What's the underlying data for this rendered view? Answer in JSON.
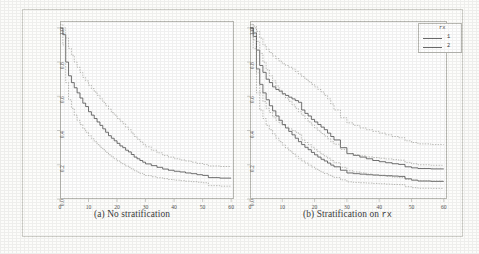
{
  "figure": {
    "background_color": "#fdfdfb",
    "frame_color": "#cfcfc9",
    "axis_color": "#b9b9b3",
    "solid_curve_color": "#5a5a5a",
    "dashed_band_color": "#9a9a94"
  },
  "panels": [
    {
      "id": "a",
      "caption_prefix": "(a)",
      "caption_text": "No stratification",
      "caption_mono": "",
      "legend_visible": false
    },
    {
      "id": "b",
      "caption_prefix": "(b)",
      "caption_text": "Stratification on",
      "caption_mono": "rx",
      "legend_visible": true
    }
  ],
  "legend": {
    "title": "rx",
    "entries": [
      {
        "label": "1",
        "style": "solid"
      },
      {
        "label": "2",
        "style": "solid"
      }
    ]
  },
  "axes": {
    "y_ticks": [
      "0.0",
      "0.2",
      "0.4",
      "0.6",
      "0.8",
      "1.0"
    ],
    "y_values": [
      0.0,
      0.2,
      0.4,
      0.6,
      0.8,
      1.0
    ],
    "x_ticks": [
      "0",
      "10",
      "20",
      "30",
      "40",
      "50",
      "60"
    ],
    "x_values": [
      0,
      10,
      20,
      30,
      40,
      50,
      60
    ],
    "xlim": [
      0,
      61
    ],
    "ylim": [
      0.0,
      1.04
    ],
    "xlabel": "",
    "ylabel": ""
  },
  "chart_data": {
    "type": "line",
    "title": "",
    "xlabel": "",
    "ylabel": "",
    "xlim": [
      0,
      61
    ],
    "ylim": [
      0.0,
      1.04
    ],
    "grid": false,
    "legend_position": "top-right",
    "panels": [
      {
        "id": "a",
        "caption": "(a) No stratification",
        "series": [
          {
            "name": "estimate",
            "style": "solid",
            "x": [
              0,
              1,
              2,
              3,
              4,
              5,
              6,
              7,
              8,
              9,
              10,
              11,
              12,
              13,
              14,
              15,
              16,
              17,
              18,
              19,
              20,
              21,
              22,
              23,
              24,
              25,
              26,
              27,
              28,
              29,
              30,
              32,
              34,
              36,
              38,
              40,
              42,
              44,
              46,
              48,
              50,
              52,
              56,
              60
            ],
            "y": [
              1.0,
              0.96,
              0.8,
              0.72,
              0.68,
              0.65,
              0.62,
              0.59,
              0.56,
              0.54,
              0.51,
              0.49,
              0.47,
              0.45,
              0.43,
              0.41,
              0.39,
              0.37,
              0.355,
              0.34,
              0.325,
              0.31,
              0.3,
              0.285,
              0.275,
              0.26,
              0.245,
              0.235,
              0.225,
              0.215,
              0.205,
              0.195,
              0.185,
              0.175,
              0.168,
              0.162,
              0.158,
              0.152,
              0.148,
              0.142,
              0.138,
              0.125,
              0.122,
              0.122
            ]
          },
          {
            "name": "upper-confidence-band",
            "style": "dotted",
            "x": [
              0,
              1,
              2,
              3,
              4,
              5,
              6,
              7,
              8,
              9,
              10,
              11,
              12,
              13,
              14,
              15,
              16,
              17,
              18,
              19,
              20,
              21,
              22,
              23,
              24,
              25,
              26,
              27,
              28,
              29,
              30,
              32,
              34,
              36,
              38,
              40,
              42,
              44,
              46,
              48,
              50,
              52,
              56,
              60
            ],
            "y": [
              1.02,
              1.0,
              0.94,
              0.88,
              0.84,
              0.8,
              0.77,
              0.74,
              0.71,
              0.69,
              0.665,
              0.645,
              0.625,
              0.605,
              0.585,
              0.565,
              0.545,
              0.525,
              0.505,
              0.49,
              0.47,
              0.455,
              0.44,
              0.42,
              0.405,
              0.385,
              0.365,
              0.35,
              0.335,
              0.32,
              0.305,
              0.285,
              0.27,
              0.255,
              0.245,
              0.235,
              0.228,
              0.222,
              0.215,
              0.208,
              0.202,
              0.193,
              0.19,
              0.19
            ]
          },
          {
            "name": "lower-confidence-band",
            "style": "dotted",
            "x": [
              0,
              1,
              2,
              3,
              4,
              5,
              6,
              7,
              8,
              9,
              10,
              11,
              12,
              13,
              14,
              15,
              16,
              17,
              18,
              19,
              20,
              21,
              22,
              23,
              24,
              25,
              26,
              27,
              28,
              29,
              30,
              32,
              34,
              36,
              38,
              40,
              42,
              44,
              46,
              48,
              50,
              52,
              56,
              60
            ],
            "y": [
              0.98,
              0.9,
              0.68,
              0.58,
              0.53,
              0.49,
              0.46,
              0.435,
              0.41,
              0.39,
              0.37,
              0.352,
              0.335,
              0.318,
              0.302,
              0.288,
              0.272,
              0.258,
              0.246,
              0.234,
              0.223,
              0.212,
              0.203,
              0.193,
              0.185,
              0.175,
              0.165,
              0.157,
              0.15,
              0.143,
              0.137,
              0.13,
              0.124,
              0.119,
              0.114,
              0.11,
              0.107,
              0.104,
              0.101,
              0.098,
              0.095,
              0.078,
              0.075,
              0.075
            ]
          }
        ]
      },
      {
        "id": "b",
        "caption": "(b) Stratification on rx",
        "series": [
          {
            "name": "rx-1-estimate",
            "style": "solid",
            "x": [
              0,
              1,
              2,
              3,
              4,
              5,
              6,
              7,
              8,
              9,
              10,
              11,
              12,
              13,
              14,
              15,
              16,
              17,
              18,
              19,
              20,
              21,
              22,
              23,
              24,
              25,
              26,
              28,
              30,
              32,
              34,
              36,
              38,
              40,
              42,
              44,
              46,
              48,
              50,
              52,
              56,
              60
            ],
            "y": [
              1.0,
              0.97,
              0.87,
              0.78,
              0.74,
              0.7,
              0.68,
              0.655,
              0.64,
              0.63,
              0.615,
              0.605,
              0.595,
              0.585,
              0.575,
              0.565,
              0.52,
              0.5,
              0.485,
              0.465,
              0.45,
              0.435,
              0.42,
              0.405,
              0.385,
              0.365,
              0.345,
              0.3,
              0.265,
              0.255,
              0.245,
              0.235,
              0.225,
              0.218,
              0.212,
              0.206,
              0.202,
              0.188,
              0.182,
              0.178,
              0.176,
              0.176
            ]
          },
          {
            "name": "rx-2-estimate",
            "style": "solid",
            "x": [
              0,
              1,
              2,
              3,
              4,
              5,
              6,
              7,
              8,
              9,
              10,
              11,
              12,
              13,
              14,
              15,
              16,
              17,
              18,
              19,
              20,
              21,
              22,
              23,
              24,
              25,
              26,
              28,
              30,
              32,
              34,
              36,
              38,
              40,
              42,
              44,
              46,
              48,
              50,
              52,
              56,
              60
            ],
            "y": [
              1.0,
              0.95,
              0.76,
              0.67,
              0.62,
              0.58,
              0.545,
              0.515,
              0.485,
              0.46,
              0.435,
              0.415,
              0.395,
              0.375,
              0.355,
              0.335,
              0.318,
              0.302,
              0.288,
              0.272,
              0.258,
              0.245,
              0.232,
              0.222,
              0.21,
              0.198,
              0.188,
              0.168,
              0.152,
              0.148,
              0.145,
              0.142,
              0.14,
              0.138,
              0.136,
              0.134,
              0.132,
              0.118,
              0.11,
              0.105,
              0.103,
              0.103
            ]
          },
          {
            "name": "rx-1-upper-band",
            "style": "dotted",
            "x": [
              0,
              1,
              2,
              3,
              4,
              5,
              6,
              7,
              8,
              9,
              10,
              11,
              12,
              13,
              14,
              15,
              16,
              17,
              18,
              19,
              20,
              21,
              22,
              23,
              24,
              25,
              26,
              28,
              30,
              32,
              34,
              36,
              38,
              40,
              42,
              44,
              46,
              48,
              50,
              52,
              56,
              60
            ],
            "y": [
              1.02,
              1.01,
              0.98,
              0.94,
              0.9,
              0.875,
              0.855,
              0.835,
              0.82,
              0.805,
              0.79,
              0.78,
              0.77,
              0.76,
              0.745,
              0.73,
              0.715,
              0.7,
              0.685,
              0.67,
              0.655,
              0.64,
              0.625,
              0.605,
              0.585,
              0.555,
              0.52,
              0.475,
              0.445,
              0.43,
              0.415,
              0.405,
              0.395,
              0.385,
              0.375,
              0.365,
              0.358,
              0.34,
              0.33,
              0.322,
              0.318,
              0.318
            ]
          },
          {
            "name": "rx-1-lower-band",
            "style": "dotted",
            "x": [
              0,
              1,
              2,
              3,
              4,
              5,
              6,
              7,
              8,
              9,
              10,
              11,
              12,
              13,
              14,
              15,
              16,
              17,
              18,
              19,
              20,
              21,
              22,
              23,
              24,
              25,
              26,
              28,
              30,
              32,
              34,
              36,
              38,
              40,
              42,
              44,
              46,
              48,
              50,
              52,
              56,
              60
            ],
            "y": [
              0.99,
              0.93,
              0.74,
              0.62,
              0.57,
              0.53,
              0.505,
              0.48,
              0.46,
              0.445,
              0.43,
              0.42,
              0.41,
              0.4,
              0.39,
              0.378,
              0.345,
              0.33,
              0.318,
              0.302,
              0.288,
              0.275,
              0.262,
              0.25,
              0.238,
              0.225,
              0.212,
              0.185,
              0.165,
              0.158,
              0.152,
              0.146,
              0.14,
              0.136,
              0.132,
              0.128,
              0.125,
              0.115,
              0.11,
              0.107,
              0.105,
              0.105
            ]
          },
          {
            "name": "rx-2-upper-band",
            "style": "dotted",
            "x": [
              0,
              1,
              2,
              3,
              4,
              5,
              6,
              7,
              8,
              9,
              10,
              11,
              12,
              13,
              14,
              15,
              16,
              17,
              18,
              19,
              20,
              21,
              22,
              23,
              24,
              25,
              26,
              28,
              30,
              32,
              34,
              36,
              38,
              40,
              42,
              44,
              46,
              48,
              50,
              52,
              56,
              60
            ],
            "y": [
              1.02,
              1.0,
              0.92,
              0.85,
              0.8,
              0.755,
              0.72,
              0.69,
              0.66,
              0.635,
              0.61,
              0.59,
              0.57,
              0.55,
              0.53,
              0.51,
              0.49,
              0.47,
              0.45,
              0.432,
              0.415,
              0.398,
              0.382,
              0.368,
              0.352,
              0.335,
              0.32,
              0.29,
              0.265,
              0.258,
              0.252,
              0.246,
              0.242,
              0.238,
              0.234,
              0.23,
              0.227,
              0.214,
              0.206,
              0.2,
              0.197,
              0.197
            ]
          },
          {
            "name": "rx-2-lower-band",
            "style": "dotted",
            "x": [
              0,
              1,
              2,
              3,
              4,
              5,
              6,
              7,
              8,
              9,
              10,
              11,
              12,
              13,
              14,
              15,
              16,
              17,
              18,
              19,
              20,
              21,
              22,
              23,
              24,
              25,
              26,
              28,
              30,
              32,
              34,
              36,
              38,
              40,
              42,
              44,
              46,
              48,
              50,
              52,
              56,
              60
            ],
            "y": [
              0.98,
              0.88,
              0.62,
              0.52,
              0.47,
              0.43,
              0.405,
              0.38,
              0.355,
              0.335,
              0.315,
              0.298,
              0.282,
              0.266,
              0.25,
              0.235,
              0.222,
              0.21,
              0.198,
              0.187,
              0.176,
              0.166,
              0.157,
              0.149,
              0.141,
              0.133,
              0.126,
              0.112,
              0.1,
              0.097,
              0.095,
              0.093,
              0.091,
              0.089,
              0.087,
              0.085,
              0.084,
              0.072,
              0.066,
              0.063,
              0.062,
              0.062
            ]
          }
        ]
      }
    ]
  }
}
